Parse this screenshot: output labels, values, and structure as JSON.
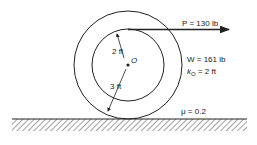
{
  "diagram": {
    "type": "mechanics-free-body",
    "force": {
      "label": "P = 130 lb"
    },
    "inner_radius": {
      "label": "2 ft"
    },
    "outer_radius": {
      "label": "3 ft"
    },
    "center": {
      "label": "O"
    },
    "weight": {
      "label": "W = 161 lb"
    },
    "radius_of_gyration": {
      "symbol": "k",
      "subscript": "O",
      "value": " = 2 ft"
    },
    "friction": {
      "label": "μ = 0.2"
    },
    "colors": {
      "line": "#222222",
      "background": "#ffffff"
    }
  }
}
